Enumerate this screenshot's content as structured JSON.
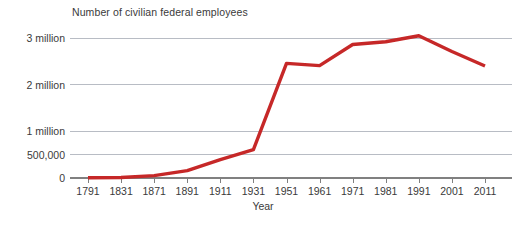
{
  "chart_data": {
    "type": "line",
    "title": "Number of civilian federal employees",
    "xlabel": "Year",
    "ylabel": "",
    "categories": [
      "1791",
      "1831",
      "1871",
      "1891",
      "1911",
      "1931",
      "1951",
      "1961",
      "1971",
      "1981",
      "1991",
      "2001",
      "2011"
    ],
    "values": [
      4500,
      11500,
      51000,
      157000,
      396000,
      610000,
      2456000,
      2407000,
      2860000,
      2920000,
      3048000,
      2710000,
      2400000
    ],
    "series": [
      {
        "name": "Civilian federal employees",
        "color": "#C62828",
        "values": [
          4500,
          11500,
          51000,
          157000,
          396000,
          610000,
          2456000,
          2407000,
          2860000,
          2920000,
          3048000,
          2710000,
          2400000
        ]
      }
    ],
    "ytick_labels": [
      "0",
      "500,000",
      "1 million",
      "2 million",
      "3 million"
    ],
    "ytick_values": [
      0,
      500000,
      1000000,
      2000000,
      3000000
    ],
    "ylim": [
      0,
      3200000
    ],
    "grid": true,
    "grid_axis": "y",
    "legend": false,
    "line_color": "#C62828",
    "grid_color": "#b8bcc4",
    "axis_color": "#808080",
    "background": "#ffffff"
  },
  "axis": {
    "x_label": "Year",
    "y_labels": {
      "zero": "0",
      "half_million": "500,000",
      "one_million": "1 million",
      "two_million": "2 million",
      "three_million": "3 million"
    }
  }
}
